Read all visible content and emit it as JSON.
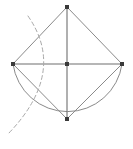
{
  "figure": {
    "canvas": {
      "width": 133,
      "height": 149,
      "background": "#ffffff"
    },
    "colors": {
      "stroke": "#8a8a8a",
      "stroke_dark": "#6f6f6f",
      "dashed_stroke": "#a9a9a9",
      "vertex_fill": "#3a3a3a",
      "background": "#ffffff"
    },
    "stroke_widths": {
      "edge": 1,
      "diagonal": 1.1,
      "circle": 1,
      "dashed": 1
    },
    "points": [
      {
        "id": "top",
        "label": "A",
        "x": 67,
        "y": 7,
        "marker": "square"
      },
      {
        "id": "left",
        "label": "B",
        "x": 13,
        "y": 64,
        "marker": "square"
      },
      {
        "id": "right",
        "label": "C",
        "x": 122,
        "y": 64,
        "marker": "square"
      },
      {
        "id": "bottom",
        "label": "D",
        "x": 67,
        "y": 119,
        "marker": "square"
      },
      {
        "id": "center",
        "label": "O",
        "x": 67,
        "y": 64,
        "marker": "square"
      }
    ],
    "marker_size": 4,
    "segments": [
      {
        "id": "edge-top-left",
        "from": "top",
        "to": "left",
        "style": "solid"
      },
      {
        "id": "edge-top-right",
        "from": "top",
        "to": "right",
        "style": "solid"
      },
      {
        "id": "edge-left-bottom",
        "from": "left",
        "to": "bottom",
        "style": "solid"
      },
      {
        "id": "edge-bottom-right",
        "from": "bottom",
        "to": "right",
        "style": "solid"
      },
      {
        "id": "diagonal-vertical",
        "from": "top",
        "to": "bottom",
        "style": "solid"
      },
      {
        "id": "diagonal-horizontal",
        "from": "left",
        "to": "right",
        "style": "solid"
      }
    ],
    "semicircle": {
      "id": "main-semicircle",
      "center_x": 67,
      "center_y": 64,
      "radius": 55,
      "start_x": 13,
      "start_y": 64,
      "end_x": 122,
      "end_y": 64,
      "sweep": "lower-half",
      "style": "solid"
    },
    "dashed_arc": {
      "id": "construction-arc",
      "start_x": 28,
      "start_y": 16,
      "control_x": 67,
      "control_y": 72,
      "end_x": 9,
      "end_y": 133,
      "style": "dashed",
      "dash_pattern": "4 3"
    }
  }
}
